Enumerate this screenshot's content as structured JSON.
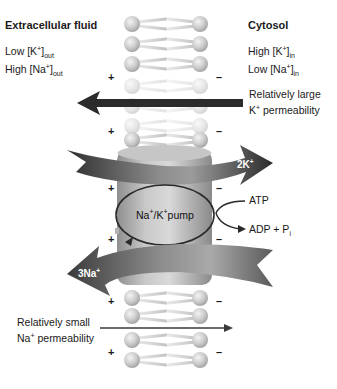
{
  "diagram": {
    "extracellular": {
      "heading": "Extracellular fluid",
      "k_line": {
        "prefix": "Low  [K",
        "sup": "+",
        "suffix": "]",
        "sub": "out"
      },
      "na_line": {
        "prefix": "High [Na",
        "sup": "+",
        "suffix": "]",
        "sub": "out"
      }
    },
    "cytosol": {
      "heading": "Cytosol",
      "k_line": {
        "prefix": "High [K",
        "sup": "+",
        "suffix": "]",
        "sub": "in"
      },
      "na_line": {
        "prefix": "Low  [Na",
        "sup": "+",
        "suffix": "]",
        "sub": "in"
      }
    },
    "k_permeability": {
      "line1": "Relatively large",
      "line2_prefix": "K",
      "line2_sup": "+",
      "line2_suffix": " permeability",
      "direction": "cytosol-to-extracellular"
    },
    "na_permeability": {
      "line1": "Relatively small",
      "line2_prefix": "Na",
      "line2_sup": "+",
      "line2_suffix": " permeability",
      "direction": "extracellular-to-cytosol"
    },
    "k_flux": {
      "prefix": "2K",
      "sup": "+",
      "direction": "into-cytosol"
    },
    "na_flux": {
      "prefix": "3Na",
      "sup": "+",
      "direction": "out-of-cell"
    },
    "pump": {
      "prefix1": "Na",
      "sup1": "+",
      "mid": "/K",
      "sup2": "+",
      "suffix": "pump"
    },
    "atp": {
      "input": "ATP",
      "output_prefix": "ADP + P",
      "output_sub": "i"
    },
    "charges": {
      "outside": "+",
      "inside": "–"
    },
    "colors": {
      "arrow_dark": "#2b2b2b",
      "arrow_light": "#9a9a9a",
      "pump_body": "#b4b4b4",
      "lipid_head": "#c8c8c8",
      "text": "#1a1a1a"
    }
  }
}
